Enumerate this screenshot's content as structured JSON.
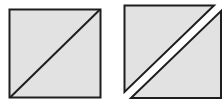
{
  "diagram": {
    "colors": {
      "fill": "#e2e2e2",
      "stroke": "#1e1e1e",
      "background": "#ffffff"
    },
    "figures": [
      {
        "name": "whole-square-with-diagonal"
      },
      {
        "name": "square-split-into-two-triangles"
      }
    ]
  }
}
